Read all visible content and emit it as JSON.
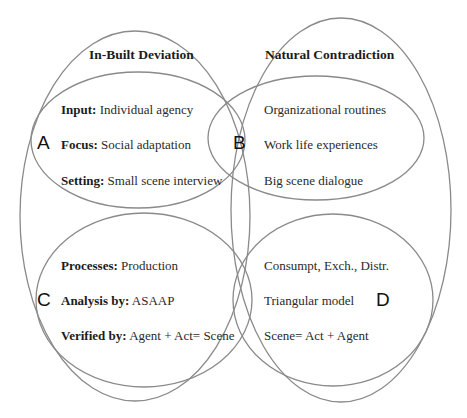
{
  "diagram": {
    "stroke_color": "#8a8a8a",
    "groups": [
      {
        "id": "left",
        "title": "In-Built Deviation"
      },
      {
        "id": "right",
        "title": "Natural Contradiction"
      }
    ],
    "quadrants": [
      {
        "letter": "A",
        "rows": [
          {
            "label": "Input:",
            "value": " Individual agency"
          },
          {
            "label": "Focus:",
            "value": " Social adaptation"
          },
          {
            "label": "Setting:",
            "value": " Small scene interview"
          }
        ]
      },
      {
        "letter": "B",
        "rows": [
          {
            "value": "Organizational routines"
          },
          {
            "value": "Work life experiences"
          },
          {
            "value": "Big scene dialogue"
          }
        ]
      },
      {
        "letter": "C",
        "rows": [
          {
            "label": "Processes:",
            "value": " Production"
          },
          {
            "label": "Analysis by:",
            "value": " ASAAP"
          },
          {
            "label": "Verified by:",
            "value": " Agent + Act= Scene"
          }
        ]
      },
      {
        "letter": "D",
        "rows": [
          {
            "value": "Consumpt, Exch., Distr."
          },
          {
            "value": "Triangular model"
          },
          {
            "value": "Scene= Act + Agent"
          }
        ]
      }
    ]
  }
}
